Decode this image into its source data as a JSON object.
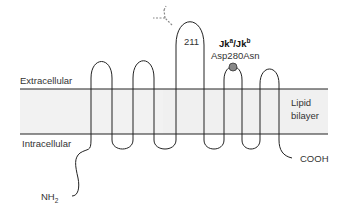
{
  "figure": {
    "regions": {
      "extracellular": "Extracellular",
      "intracellular": "Intracellular",
      "lipid_line1": "Lipid",
      "lipid_line2": "bilayer"
    },
    "termini": {
      "n_terminus": "NH",
      "n_terminus_sub": "2",
      "c_terminus": "COOH"
    },
    "glycosylation_site": "211",
    "antigen": {
      "base1": "Jk",
      "sup1": "a",
      "sep": "/",
      "base2": "Jk",
      "sup2": "b",
      "mutation": "Asp280Asn"
    },
    "colors": {
      "membrane_band": "#f0f0f0",
      "line": "#222222",
      "polymorphism_dot": "#888888"
    }
  }
}
